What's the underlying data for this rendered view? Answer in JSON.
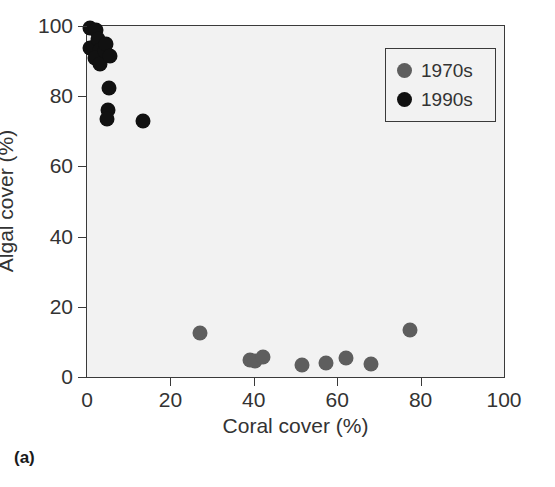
{
  "panel": {
    "label": "(a)"
  },
  "chart_data": {
    "type": "scatter",
    "title": "",
    "xlabel": "Coral cover (%)",
    "ylabel": "Algal cover (%)",
    "xlim": [
      0,
      100
    ],
    "ylim": [
      0,
      100
    ],
    "xticks": [
      0,
      20,
      40,
      60,
      80,
      100
    ],
    "yticks": [
      0,
      20,
      40,
      60,
      80,
      100
    ],
    "xtick_labels": [
      "0",
      "20",
      "40",
      "60",
      "80",
      "100"
    ],
    "ytick_labels": [
      "0",
      "20",
      "40",
      "60",
      "80",
      "100"
    ],
    "grid": false,
    "legend_position": "upper right",
    "marker_size_px": 15,
    "series": [
      {
        "name": "1970s",
        "color": "#5e5e5e",
        "points": [
          [
            27.0,
            12.5
          ],
          [
            39.0,
            4.8
          ],
          [
            40.3,
            4.5
          ],
          [
            42.3,
            5.8
          ],
          [
            51.5,
            3.3
          ],
          [
            57.3,
            4.0
          ],
          [
            62.0,
            5.3
          ],
          [
            68.0,
            3.6
          ],
          [
            77.5,
            13.5
          ]
        ]
      },
      {
        "name": "1990s",
        "color": "#111111",
        "points": [
          [
            0.8,
            99.3
          ],
          [
            2.2,
            98.8
          ],
          [
            0.6,
            93.8
          ],
          [
            1.6,
            94.0
          ],
          [
            2.6,
            96.3
          ],
          [
            3.2,
            93.2
          ],
          [
            2.0,
            91.0
          ],
          [
            3.0,
            89.2
          ],
          [
            4.3,
            92.8
          ],
          [
            4.6,
            95.0
          ],
          [
            5.6,
            91.4
          ],
          [
            5.2,
            82.3
          ],
          [
            5.0,
            76.0
          ],
          [
            4.9,
            73.4
          ],
          [
            13.5,
            73.0
          ]
        ]
      }
    ]
  }
}
